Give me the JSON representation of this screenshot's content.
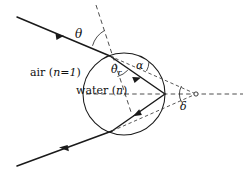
{
  "figure": {
    "labels": {
      "medium_outer": "air (n=1)",
      "medium_outer_name": "air",
      "medium_outer_index": "n=1",
      "medium_inner": "water (n)",
      "medium_inner_name": "water",
      "medium_inner_index": "n",
      "angle_incidence": "θ",
      "angle_refraction_base": "θ",
      "angle_refraction_sub": "r",
      "angle_alpha": "α",
      "angle_deviation": "δ"
    },
    "colors": {
      "background": "#ffffff",
      "ray": "#1a1a1a",
      "dashed": "#3a3a3a",
      "droplet_outline": "#1a1a1a",
      "text": "#111111"
    },
    "geometry": {
      "canvas_width": 246,
      "canvas_height": 173,
      "droplet_center_x": 124,
      "droplet_center_y": 94,
      "droplet_radius": 41,
      "entry_point_x": 110,
      "entry_point_y": 56,
      "reflection_point_x": 165,
      "reflection_point_y": 94,
      "exit_point_x": 112,
      "exit_point_y": 131,
      "incident_start_x": 17,
      "incident_start_y": 17,
      "outgoing_end_x": 17,
      "outgoing_end_y": 166,
      "deviation_vertex_x": 196,
      "deviation_vertex_y": 94,
      "normal_top_x": 96,
      "normal_top_y": 5
    },
    "label_positions": {
      "theta": {
        "x": 77,
        "y": 34
      },
      "theta_r": {
        "x": 113,
        "y": 70
      },
      "alpha": {
        "x": 137,
        "y": 66
      },
      "delta": {
        "x": 181,
        "y": 101
      },
      "air": {
        "x": 30,
        "y": 73
      },
      "water": {
        "x": 78,
        "y": 91
      }
    }
  }
}
